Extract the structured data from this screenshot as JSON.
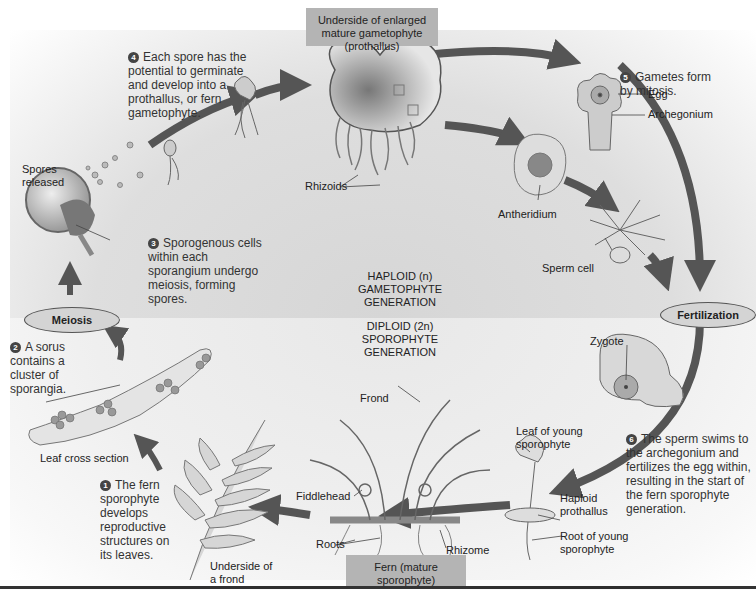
{
  "figure": {
    "title_boxes": {
      "top": "Underside of enlarged mature gametophyte (prothallus)",
      "bottom": "Fern (mature sporophyte)"
    },
    "generations": {
      "haploid": [
        "HAPLOID (n)",
        "GAMETOPHYTE",
        "GENERATION"
      ],
      "diploid": [
        "DIPLOID (2n)",
        "SPOROPHYTE",
        "GENERATION"
      ]
    },
    "events": {
      "meiosis": "Meiosis",
      "fertilization": "Fertilization"
    },
    "steps": [
      {
        "num": "1",
        "text": "The fern sporophyte develops reproductive structures on its leaves."
      },
      {
        "num": "2",
        "text": "A sorus contains a cluster of sporangia."
      },
      {
        "num": "3",
        "text": "Sporogenous cells within each sporangium undergo meiosis, forming spores."
      },
      {
        "num": "4",
        "text": "Each spore has the potential to germinate and develop into a prothallus, or fern gametophyte."
      },
      {
        "num": "5",
        "text": "Gametes form by mitosis."
      },
      {
        "num": "6",
        "text": "The sperm swims to the archegonium and fertilizes the egg within, resulting in the start of the fern sporophyte generation."
      }
    ],
    "labels": {
      "spores_released": "Spores released",
      "rhizoids": "Rhizoids",
      "antheridium": "Antheridium",
      "egg": "Egg",
      "archegonium": "Archegonium",
      "sperm_cell": "Sperm cell",
      "zygote": "Zygote",
      "leaf_cross_section": "Leaf cross section",
      "underside_frond": "Underside of a frond",
      "frond": "Frond",
      "fiddlehead": "Fiddlehead",
      "roots": "Roots",
      "rhizome": "Rhizome",
      "leaf_young_sporophyte": "Leaf of young sporophyte",
      "haploid_prothallus": "Haploid prothallus",
      "root_young_sporophyte": "Root of young sporophyte"
    },
    "colors": {
      "arrow": "#555555",
      "oval_fill": "#d4d4d4",
      "title_box": "#b4b4b4",
      "badge": "#444444"
    }
  }
}
